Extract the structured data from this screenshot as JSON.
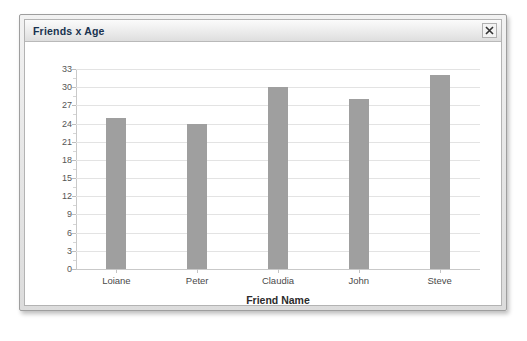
{
  "window": {
    "title": "Friends x Age",
    "close_icon": "close-icon",
    "close_label": "×"
  },
  "chart_data": {
    "type": "bar",
    "title": "Friends x Age",
    "categories": [
      "Loiane",
      "Peter",
      "Claudia",
      "John",
      "Steve"
    ],
    "values": [
      25,
      24,
      30,
      28,
      32
    ],
    "xlabel": "Friend Name",
    "ylabel": "",
    "ylim": [
      0,
      33
    ],
    "ytick_values": [
      0,
      3,
      6,
      9,
      12,
      15,
      18,
      21,
      24,
      27,
      30,
      33
    ],
    "ytick_labels": [
      "0",
      "3",
      "6",
      "9",
      "12",
      "15",
      "18",
      "21",
      "24",
      "27",
      "30",
      "33"
    ],
    "grid": true,
    "legend": false,
    "bar_color": "#9f9f9f",
    "grid_color": "#e3e3e3",
    "axis_color": "#c9c9c9"
  }
}
